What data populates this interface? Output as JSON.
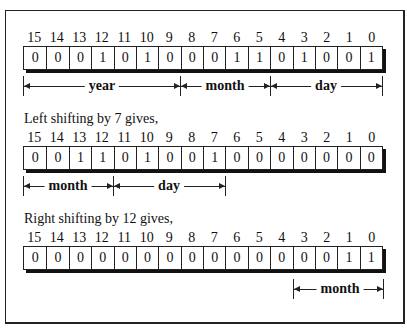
{
  "bit_positions": [
    "15",
    "14",
    "13",
    "12",
    "11",
    "10",
    "9",
    "8",
    "7",
    "6",
    "5",
    "4",
    "3",
    "2",
    "1",
    "0"
  ],
  "rows": [
    {
      "bits": [
        "0",
        "0",
        "0",
        "1",
        "0",
        "1",
        "0",
        "0",
        "0",
        "1",
        "1",
        "0",
        "1",
        "0",
        "0",
        "1"
      ],
      "fields": [
        {
          "label": "year",
          "from_bit": 15,
          "to_bit": 9
        },
        {
          "label": "month",
          "from_bit": 8,
          "to_bit": 5
        },
        {
          "label": "day",
          "from_bit": 4,
          "to_bit": 0
        }
      ]
    },
    {
      "caption": "Left shifting by 7 gives,",
      "bits": [
        "0",
        "0",
        "1",
        "1",
        "0",
        "1",
        "0",
        "0",
        "1",
        "0",
        "0",
        "0",
        "0",
        "0",
        "0",
        "0"
      ],
      "fields": [
        {
          "label": "month",
          "from_bit": 15,
          "to_bit": 12
        },
        {
          "label": "day",
          "from_bit": 11,
          "to_bit": 7
        }
      ]
    },
    {
      "caption": "Right shifting by 12 gives,",
      "bits": [
        "0",
        "0",
        "0",
        "0",
        "0",
        "0",
        "0",
        "0",
        "0",
        "0",
        "0",
        "0",
        "0",
        "0",
        "1",
        "1"
      ],
      "fields": [
        {
          "label": "month",
          "from_bit": 3,
          "to_bit": 0
        }
      ]
    }
  ]
}
